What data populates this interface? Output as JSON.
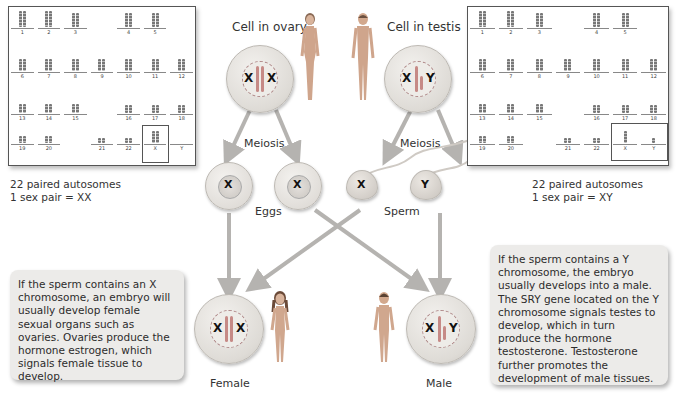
{
  "female_karyotype": {
    "autosome_labels": [
      "1",
      "2",
      "3",
      "4",
      "5",
      "6",
      "7",
      "8",
      "9",
      "10",
      "11",
      "12",
      "13",
      "14",
      "15",
      "16",
      "17",
      "18",
      "19",
      "20",
      "21",
      "22"
    ],
    "sex_labels": [
      "X",
      "Y"
    ],
    "caption_line1": "22 paired autosomes",
    "caption_line2": "1 sex pair = XX"
  },
  "male_karyotype": {
    "autosome_labels": [
      "1",
      "2",
      "3",
      "4",
      "5",
      "6",
      "7",
      "8",
      "9",
      "10",
      "11",
      "12",
      "13",
      "14",
      "15",
      "16",
      "17",
      "18",
      "19",
      "20",
      "21",
      "22"
    ],
    "sex_labels": [
      "X",
      "Y"
    ],
    "caption_line1": "22 paired autosomes",
    "caption_line2": "1 sex pair = XY"
  },
  "labels": {
    "cell_in_ovary": "Cell in ovary",
    "cell_in_testis": "Cell in testis",
    "meiosis_left": "Meiosis",
    "meiosis_right": "Meiosis",
    "eggs": "Eggs",
    "sperm": "Sperm",
    "female": "Female",
    "male": "Male"
  },
  "chromosomes": {
    "ovary_left": "X",
    "ovary_right": "X",
    "testis_left": "X",
    "testis_right": "Y",
    "egg1": "X",
    "egg2": "X",
    "sperm1": "X",
    "sperm2": "Y",
    "female_left": "X",
    "female_right": "X",
    "male_left": "X",
    "male_right": "Y"
  },
  "textboxes": {
    "female": "If the sperm contains an X chromosome, an embryo will usually develop female sexual organs such as ovaries. Ovaries produce the hormone estrogen, which signals female tissue to develop.",
    "male": "If the sperm contains a Y chromosome, the embryo usually develops into a male. The SRY gene located on the Y chromosome signals testes to develop, which in turn produce the hormone testosterone. Testosterone further promotes the development of male tissues."
  },
  "colors": {
    "arrow": "#b5b3b0",
    "chromosome_bar": "#c68a86",
    "textbox_bg": "#ecebe9"
  }
}
